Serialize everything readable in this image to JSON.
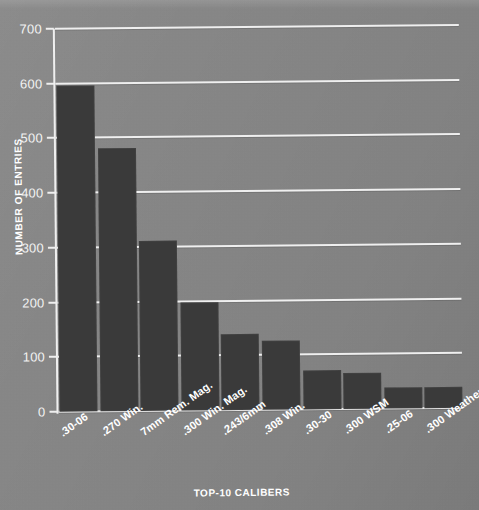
{
  "chart_data": {
    "type": "bar",
    "title": "",
    "xlabel": "TOP-10 CALIBERS",
    "ylabel": "NUMBER OF ENTRIES",
    "categories": [
      ".30-06",
      ".270 Win.",
      "7mm Rem. Mag.",
      ".300 Win. Mag.",
      ".243/6mm",
      ".308 Win.",
      ".30-30",
      ".300 WSM",
      ".25-06",
      ".300 Weatherby"
    ],
    "values": [
      595,
      480,
      310,
      198,
      138,
      127,
      72,
      66,
      38,
      38
    ],
    "ylim": [
      0,
      700
    ],
    "ytick_values": [
      0,
      100,
      200,
      300,
      400,
      500,
      600,
      700
    ],
    "ytick_labels": [
      "0",
      "100",
      "200",
      "300",
      "400",
      "500",
      "600",
      "700"
    ],
    "grid": true,
    "legend": false,
    "colors": {
      "background": "#878787",
      "bar": "#3a3a3a",
      "gridline": "#efefef",
      "text": "#ffffff"
    }
  }
}
